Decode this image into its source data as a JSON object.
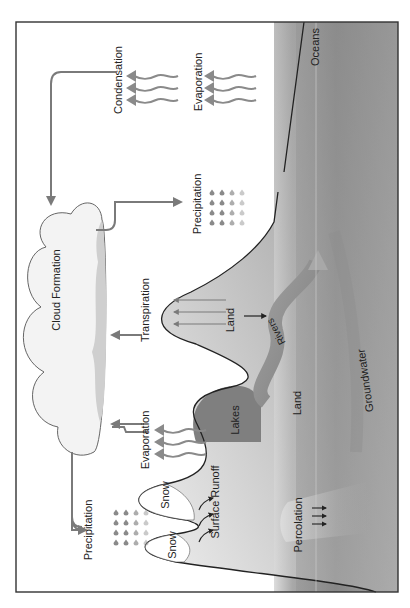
{
  "diagram": {
    "orientation": "rotated -90deg (text reads bottom-to-top)",
    "labels": {
      "oceans": "Oceans",
      "condensation": "Condensation",
      "evaporation_ocean": "Evaporation",
      "precipitation_ocean": "Precipitation",
      "cloud_formation": "Cloud Formation",
      "transpiration": "Transpiration",
      "land_hill": "Land",
      "rivers": "Rivers",
      "lakes": "Lakes",
      "land_ground": "Land",
      "groundwater": "Groundwater",
      "evaporation_lake": "Evaporation",
      "precipitation_land": "Precipitation",
      "snow_1": "Snow",
      "snow_2": "Snow",
      "surface_runoff": "Surface Runoff",
      "percolation": "Percolation"
    },
    "nodes": [
      "Cloud Formation",
      "Condensation",
      "Evaporation",
      "Precipitation",
      "Transpiration",
      "Surface Runoff",
      "Percolation",
      "Rivers",
      "Lakes",
      "Groundwater",
      "Oceans",
      "Land",
      "Snow"
    ],
    "edges": [
      {
        "from": "Condensation",
        "to": "Cloud Formation"
      },
      {
        "from": "Cloud Formation",
        "to": "Precipitation (over ocean)"
      },
      {
        "from": "Cloud Formation",
        "to": "Precipitation (over land)"
      },
      {
        "from": "Transpiration",
        "to": "Cloud Formation"
      },
      {
        "from": "Evaporation (lakes)",
        "to": "Cloud Formation"
      },
      {
        "from": "Land",
        "to": "Rivers"
      },
      {
        "from": "Rivers",
        "to": "Oceans"
      }
    ],
    "colors": {
      "frame": "#333333",
      "arrow": "#7a7a7a",
      "ocean_dark": "#8a8a8a",
      "ocean_light": "#c8c8c8",
      "land_light": "#e6e6e6",
      "land_dark": "#8c8c8c",
      "lake": "#7f7f7f",
      "river": "#8d8d8d",
      "cloud_fill": "#f2f2f2",
      "cloud_shadow": "#cfcfcf"
    }
  }
}
